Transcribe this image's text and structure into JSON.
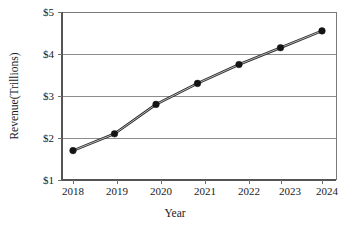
{
  "chart_data": {
    "type": "line",
    "title": "",
    "xlabel": "Year",
    "ylabel": "Revenue(Trillions)",
    "categories": [
      "2018",
      "2019",
      "2020",
      "2021",
      "2022",
      "2023",
      "2024"
    ],
    "x": [
      2018,
      2019,
      2020,
      2021,
      2022,
      2023,
      2024
    ],
    "values": [
      1.7,
      2.1,
      2.8,
      3.3,
      3.75,
      4.15,
      4.55
    ],
    "series": [
      {
        "name": "Revenue",
        "values": [
          1.7,
          2.1,
          2.8,
          3.3,
          3.75,
          4.15,
          4.55
        ]
      }
    ],
    "ylim": [
      1,
      5
    ],
    "xlim": [
      2018,
      2024
    ],
    "yticks": [
      1,
      2,
      3,
      4,
      5
    ],
    "ytick_labels": [
      "$1",
      "$2",
      "$3",
      "$4",
      "$5"
    ],
    "xtick_labels": [
      "2018",
      "2019",
      "2020",
      "2021",
      "2022",
      "2023",
      "2024"
    ],
    "grid": "horizontal",
    "legend": "none",
    "marker": "filled-circle",
    "line_color": "#2b2b2b",
    "marker_color": "#141414",
    "grid_color": "#8c8c8c",
    "background_color": "#ffffff"
  },
  "axes": {
    "y_title": "Revenue(Trillions)",
    "x_title": "Year"
  },
  "ticks": {
    "y": [
      {
        "label": "$5"
      },
      {
        "label": "$4"
      },
      {
        "label": "$3"
      },
      {
        "label": "$2"
      },
      {
        "label": "$1"
      }
    ],
    "x": [
      {
        "label": "2018"
      },
      {
        "label": "2019"
      },
      {
        "label": "2020"
      },
      {
        "label": "2021"
      },
      {
        "label": "2022"
      },
      {
        "label": "2023"
      },
      {
        "label": "2024"
      }
    ]
  }
}
